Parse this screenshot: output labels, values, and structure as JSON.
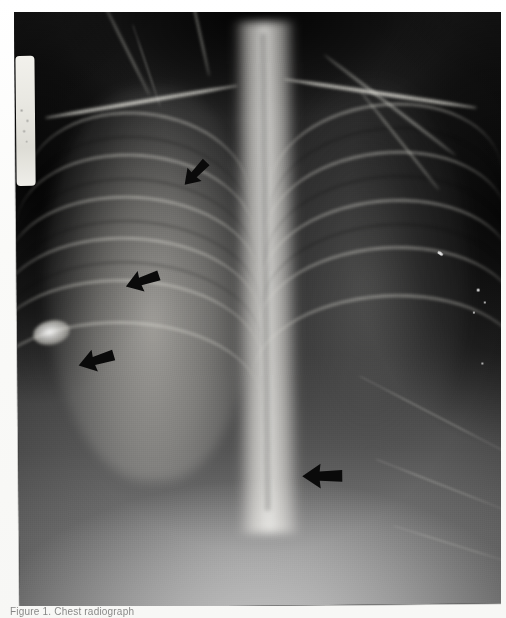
{
  "image": {
    "kind": "chest-radiograph",
    "view": "frontal AP chest x-ray",
    "caption_partial": "Figure 1.  Chest radiograph",
    "plate": {
      "left_marker_label": "",
      "background_color": "#1a1a1a",
      "border_color": "#ffffff"
    }
  },
  "annotations": {
    "arrow_color": "#0a0a0a",
    "arrows": [
      {
        "name": "arrow-1",
        "label": "arrow-upper-right-lung",
        "x": 162,
        "y": 145,
        "size": 36,
        "rotation": -46
      },
      {
        "name": "arrow-2",
        "label": "arrow-mid-right-lung",
        "x": 106,
        "y": 250,
        "size": 40,
        "rotation": -18
      },
      {
        "name": "arrow-3",
        "label": "arrow-lower-right-lung",
        "x": 58,
        "y": 328,
        "size": 42,
        "rotation": -16
      },
      {
        "name": "arrow-4",
        "label": "arrow-retrocardiac",
        "x": 281,
        "y": 444,
        "size": 46,
        "rotation": 0
      }
    ]
  },
  "findings": {
    "nodule_label": "ovoid opacity",
    "right_lung_label": "right lung field",
    "left_lung_label": "left lung field",
    "spine_label": "mediastinum and spine",
    "diaphragm_label": "diaphragm / upper abdomen"
  }
}
